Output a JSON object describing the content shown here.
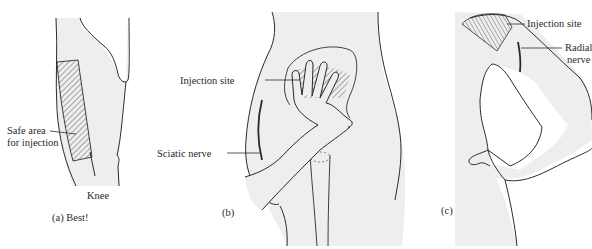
{
  "figure": {
    "panels": [
      {
        "id": "a",
        "caption": "(a) Best!",
        "subject": "thigh-lateral",
        "labels": {
          "safe_area_line1": "Safe area",
          "safe_area_line2": "for injection",
          "knee": "Knee"
        }
      },
      {
        "id": "b",
        "caption": "(b)",
        "subject": "buttock-ventrogluteal",
        "labels": {
          "injection_site": "Injection site",
          "sciatic_nerve": "Sciatic nerve"
        }
      },
      {
        "id": "c",
        "caption": "(c)",
        "subject": "upper-arm-deltoid",
        "labels": {
          "injection_site": "Injection site",
          "radial_nerve_line1": "Radial",
          "radial_nerve_line2": "nerve"
        }
      }
    ],
    "colors": {
      "skin_fill": "#eeeeee",
      "outline": "#2b2b2b",
      "background": "#ffffff"
    }
  }
}
